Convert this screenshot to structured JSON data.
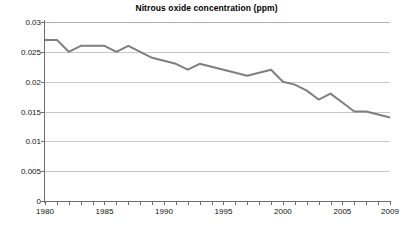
{
  "chart_data": {
    "type": "line",
    "title": "Nitrous oxide concentration (ppm)",
    "xlabel": "",
    "ylabel": "",
    "xlim": [
      1980,
      2009
    ],
    "ylim": [
      0,
      0.03
    ],
    "grid": true,
    "legend": "none",
    "line_color": "#7f7f7f",
    "x": [
      1980,
      1981,
      1982,
      1983,
      1984,
      1985,
      1986,
      1987,
      1988,
      1989,
      1990,
      1991,
      1992,
      1993,
      1994,
      1995,
      1996,
      1997,
      1998,
      1999,
      2000,
      2001,
      2002,
      2003,
      2004,
      2005,
      2006,
      2007,
      2008,
      2009
    ],
    "values": [
      0.027,
      0.027,
      0.025,
      0.026,
      0.026,
      0.026,
      0.025,
      0.026,
      0.025,
      0.024,
      0.0235,
      0.023,
      0.022,
      0.023,
      0.0225,
      0.022,
      0.0215,
      0.021,
      0.0215,
      0.022,
      0.02,
      0.0195,
      0.0185,
      0.017,
      0.018,
      0.0165,
      0.015,
      0.015,
      0.0145,
      0.014
    ],
    "series": [
      {
        "name": "Nitrous oxide concentration",
        "values": [
          0.027,
          0.027,
          0.025,
          0.026,
          0.026,
          0.026,
          0.025,
          0.026,
          0.025,
          0.024,
          0.0235,
          0.023,
          0.022,
          0.023,
          0.0225,
          0.022,
          0.0215,
          0.021,
          0.0215,
          0.022,
          0.02,
          0.0195,
          0.0185,
          0.017,
          0.018,
          0.0165,
          0.015,
          0.015,
          0.0145,
          0.014
        ]
      }
    ],
    "y_ticks": [
      0,
      0.005,
      0.01,
      0.015,
      0.02,
      0.025,
      0.03
    ],
    "y_tick_labels": [
      "0",
      "0.005",
      "0.01",
      "0.015",
      "0.02",
      "0.025",
      "0.03"
    ],
    "x_tick_labels": [
      "1980",
      "1985",
      "1990",
      "1995",
      "2000",
      "2005",
      "2009"
    ],
    "x_tick_values": [
      1980,
      1985,
      1990,
      1995,
      2000,
      2005,
      2009
    ],
    "x_minor_tick_step": 1
  },
  "caption": {
    "text": ""
  }
}
